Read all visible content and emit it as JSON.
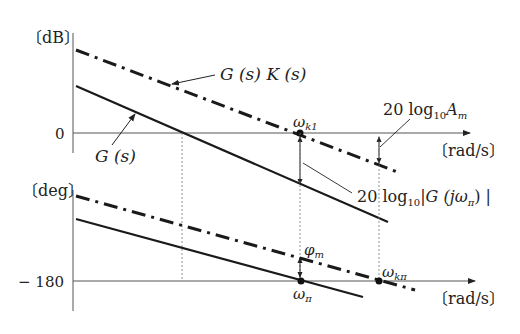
{
  "diagram": {
    "type": "bode-plot-gain-phase-margin",
    "gain_plot": {
      "y_unit": "〔dB〕",
      "y_zero_label": "0",
      "x_unit": "〔rad/s〕",
      "curve_G_label": "G (s)",
      "curve_GK_label": "G (s) K (s)",
      "omega_k1_label": "ωk1",
      "omega_k1_main": "ω",
      "omega_k1_sub": "k1",
      "gain_margin_label_main": "20 log",
      "gain_margin_label_sub": "10",
      "gain_margin_label_tail": "A",
      "gain_margin_label_tail_sub": "m",
      "gain_value_label_main": "20 log",
      "gain_value_label_sub": "10",
      "gain_value_label_tail": "|G (jω",
      "gain_value_label_tail_sub": "π",
      "gain_value_label_end": ") |"
    },
    "phase_plot": {
      "y_unit": "〔deg〕",
      "y_ref_label": "− 180",
      "x_unit": "〔rad/s〕",
      "phase_margin_main": "φ",
      "phase_margin_sub": "m",
      "omega_pi_main": "ω",
      "omega_pi_sub": "π",
      "omega_kpi_main": "ω",
      "omega_kpi_sub": "kπ"
    },
    "colors": {
      "line": "#1a1a1a",
      "axis": "#555555",
      "guide": "#777777"
    }
  }
}
